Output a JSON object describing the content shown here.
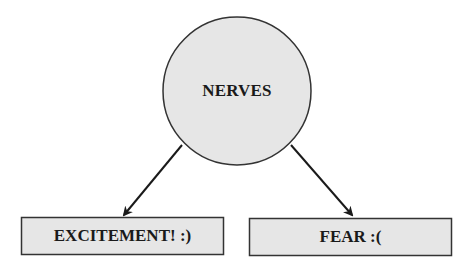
{
  "diagram": {
    "root": {
      "label": "NERVES",
      "shape": "circle",
      "fill": "#e6e6e6",
      "stroke": "#333333"
    },
    "children": [
      {
        "label": "EXCITEMENT! :)",
        "shape": "rectangle",
        "fill": "#e6e6e6",
        "stroke": "#333333"
      },
      {
        "label": "FEAR :(",
        "shape": "rectangle",
        "fill": "#e6e6e6",
        "stroke": "#333333"
      }
    ],
    "edges": [
      {
        "from": "NERVES",
        "to": "EXCITEMENT! :)",
        "type": "arrow"
      },
      {
        "from": "NERVES",
        "to": "FEAR :(",
        "type": "arrow"
      }
    ]
  }
}
